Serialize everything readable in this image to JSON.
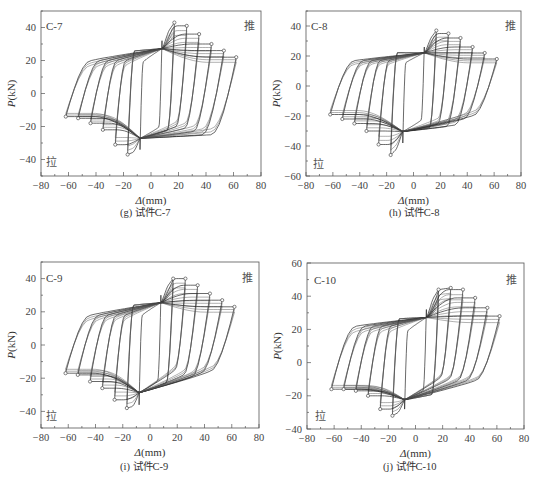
{
  "figure": {
    "width": 535,
    "height": 492,
    "line_color": "#222222",
    "frame_color": "#555555"
  },
  "chart_data": [
    {
      "type": "line",
      "panel": "g",
      "id": "C-7",
      "caption": "(g) 试件C-7",
      "title": "C-7",
      "push_label": "推",
      "pull_label": "拉",
      "xlabel": "Δ(mm)",
      "ylabel": "P(kN)",
      "xlim": [
        -80,
        80
      ],
      "ylim": [
        -50,
        50
      ],
      "xticks": [
        -80,
        -60,
        -40,
        -20,
        0,
        20,
        40,
        60,
        80
      ],
      "yticks": [
        -40,
        -20,
        0,
        20,
        40
      ],
      "frame": {
        "left": 41,
        "top": 11,
        "right": 261,
        "bottom": 176
      },
      "cycle_amplitudes_mm": [
        8,
        17,
        26,
        35,
        44,
        53,
        62
      ],
      "pos_envelope": {
        "x": [
          8,
          17,
          26,
          35,
          44,
          53,
          62
        ],
        "y": [
          32,
          43,
          41,
          36,
          30,
          26,
          22
        ]
      },
      "neg_envelope": {
        "x": [
          -8,
          -17,
          -26,
          -35,
          -44,
          -53,
          -62
        ],
        "y": [
          -34,
          -37,
          -31,
          -22,
          -18,
          -15,
          -14
        ]
      },
      "reload_peak_neg_side": {
        "x": [
          -62,
          -53,
          -44,
          -35,
          -26
        ],
        "y": [
          39,
          36,
          33,
          28,
          20
        ]
      },
      "reload_peak_pos_side": {
        "x": [
          26,
          35,
          44,
          53,
          62
        ],
        "y": [
          -20,
          -21,
          -23,
          -25,
          -25
        ]
      }
    },
    {
      "type": "line",
      "panel": "h",
      "id": "C-8",
      "caption": "(h) 试件C-8",
      "title": "C-8",
      "push_label": "推",
      "pull_label": "拉",
      "xlabel": "Δ(mm)",
      "ylabel": "P(kN)",
      "xlim": [
        -80,
        80
      ],
      "ylim": [
        -60,
        50
      ],
      "xticks": [
        -80,
        -60,
        -40,
        -20,
        0,
        20,
        40,
        60,
        80
      ],
      "yticks": [
        -60,
        -40,
        -20,
        0,
        20,
        40
      ],
      "frame": {
        "left": 306,
        "top": 11,
        "right": 521,
        "bottom": 176
      },
      "cycle_amplitudes_mm": [
        8,
        17,
        26,
        35,
        44,
        53,
        62
      ],
      "pos_envelope": {
        "x": [
          8,
          17,
          26,
          35,
          44,
          53,
          62
        ],
        "y": [
          26,
          37,
          35,
          32,
          26,
          22,
          18
        ]
      },
      "neg_envelope": {
        "x": [
          -8,
          -17,
          -26,
          -35,
          -44,
          -53,
          -62
        ],
        "y": [
          -38,
          -46,
          -39,
          -30,
          -25,
          -22,
          -19
        ]
      },
      "reload_peak_neg_side": {
        "x": [
          -62,
          -53,
          -44,
          -35,
          -26
        ],
        "y": [
          28,
          26,
          23,
          20,
          17
        ]
      },
      "reload_peak_pos_side": {
        "x": [
          26,
          35,
          44,
          53,
          62
        ],
        "y": [
          -25,
          -27,
          -26,
          -22,
          -20
        ]
      }
    },
    {
      "type": "line",
      "panel": "i",
      "id": "C-9",
      "caption": "(i) 试件C-9",
      "title": "C-9",
      "push_label": "推",
      "pull_label": "拉",
      "xlabel": "Δ(mm)",
      "ylabel": "P(kN)",
      "xlim": [
        -80,
        80
      ],
      "ylim": [
        -50,
        50
      ],
      "xticks": [
        -80,
        -60,
        -40,
        -20,
        0,
        20,
        40,
        60,
        80
      ],
      "yticks": [
        -40,
        -20,
        0,
        20,
        40
      ],
      "frame": {
        "left": 41,
        "top": 262,
        "right": 259,
        "bottom": 428
      },
      "cycle_amplitudes_mm": [
        8,
        17,
        26,
        35,
        44,
        53,
        62
      ],
      "pos_envelope": {
        "x": [
          8,
          17,
          26,
          35,
          44,
          53,
          62
        ],
        "y": [
          30,
          40,
          40,
          36,
          31,
          27,
          23
        ]
      },
      "neg_envelope": {
        "x": [
          -8,
          -17,
          -26,
          -35,
          -44,
          -53,
          -62
        ],
        "y": [
          -36,
          -38,
          -33,
          -26,
          -22,
          -18,
          -17
        ]
      },
      "reload_peak_neg_side": {
        "x": [
          -62,
          -53,
          -44,
          -35,
          -26
        ],
        "y": [
          29,
          27,
          24,
          21,
          18
        ]
      },
      "reload_peak_pos_side": {
        "x": [
          26,
          35,
          44,
          53,
          62
        ],
        "y": [
          -15,
          -18,
          -19,
          -17,
          -16
        ]
      }
    },
    {
      "type": "line",
      "panel": "j",
      "id": "C-10",
      "caption": "(j) 试件C-10",
      "title": "C-10",
      "push_label": "推",
      "pull_label": "拉",
      "xlabel": "Δ(mm)",
      "ylabel": "P(kN)",
      "xlim": [
        -80,
        80
      ],
      "ylim": [
        -40,
        60
      ],
      "xticks": [
        -80,
        -60,
        -40,
        -20,
        0,
        20,
        40,
        60,
        80
      ],
      "yticks": [
        -40,
        -20,
        0,
        20,
        40,
        60
      ],
      "frame": {
        "left": 307,
        "top": 263,
        "right": 524,
        "bottom": 429
      },
      "cycle_amplitudes_mm": [
        8,
        17,
        26,
        35,
        44,
        53,
        62
      ],
      "pos_envelope": {
        "x": [
          8,
          17,
          26,
          35,
          44,
          53,
          62
        ],
        "y": [
          32,
          44,
          45,
          44,
          39,
          33,
          28
        ]
      },
      "neg_envelope": {
        "x": [
          -8,
          -17,
          -26,
          -35,
          -44,
          -53,
          -62
        ],
        "y": [
          -28,
          -32,
          -28,
          -20,
          -17,
          -16,
          -16
        ]
      },
      "reload_peak_neg_side": {
        "x": [
          -62,
          -53,
          -44,
          -35,
          -26
        ],
        "y": [
          32,
          30,
          28,
          25,
          22
        ]
      },
      "reload_peak_pos_side": {
        "x": [
          26,
          35,
          44,
          53,
          62
        ],
        "y": [
          -9,
          -10,
          -11,
          -11,
          -11
        ]
      }
    }
  ]
}
